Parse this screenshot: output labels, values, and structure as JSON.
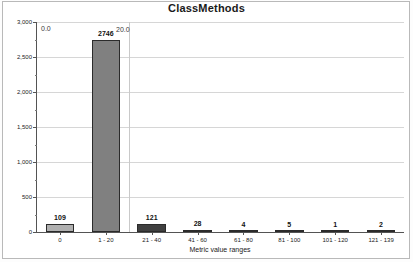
{
  "chart_data": {
    "type": "bar",
    "title": "ClassMethods",
    "xlabel": "Metric value ranges",
    "ylabel": "Number of Metric values",
    "categories": [
      "0",
      "1 - 20",
      "21 - 40",
      "41 - 60",
      "61 - 80",
      "81 - 100",
      "101 - 120",
      "121 - 139"
    ],
    "values": [
      109,
      2746,
      121,
      28,
      4,
      5,
      1,
      2
    ],
    "value_labels": [
      "109",
      "2746",
      "121",
      "28",
      "4",
      "5",
      "1",
      "2"
    ],
    "bar_colors": [
      "#b0b0b0",
      "#808080",
      "#404040",
      "#303030",
      "#2b2b2b",
      "#2b2b2b",
      "#2b2b2b",
      "#2b2b2b"
    ],
    "ylim": [
      0,
      3000
    ],
    "ytick_values": [
      0,
      500,
      1000,
      1500,
      2000,
      2500,
      3000
    ],
    "ytick_labels": [
      "0",
      "500",
      "1,000",
      "1,500",
      "2,000",
      "2,500",
      "3,000"
    ],
    "grid": true,
    "legend": "none",
    "annotations": [
      {
        "text": "0.0",
        "note": "stray tick label near top-left of plot"
      },
      {
        "text": "20.0",
        "note": "stray tick label overlapping the 2746 bar label"
      }
    ]
  },
  "colors": {
    "axis": "#545454",
    "gridline": "#d6d6d6",
    "frame": "#b9b9b9",
    "text": "#1a1a1a"
  }
}
